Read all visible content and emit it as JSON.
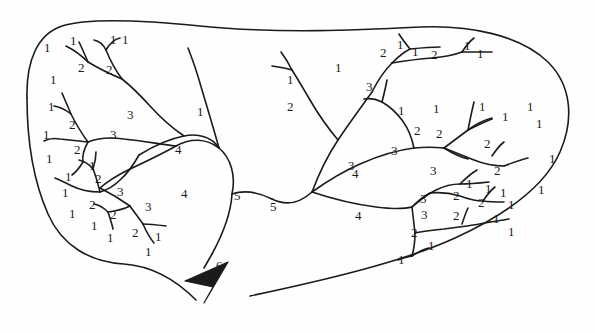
{
  "figure": {
    "type": "stream-order-network-diagram",
    "background_color": "#ffffff",
    "stroke_color": "#1b1b1b",
    "outlet_marker": "arrowhead",
    "max_order": 6,
    "order_counts": {
      "1": 48,
      "2": 19,
      "3": 9,
      "4": 4,
      "5": 2,
      "6": 1
    }
  },
  "labels": [
    {
      "text": "1",
      "x": 44,
      "y": 41
    },
    {
      "text": "1",
      "x": 70,
      "y": 34
    },
    {
      "text": "1",
      "x": 110,
      "y": 33
    },
    {
      "text": "1",
      "x": 122,
      "y": 33
    },
    {
      "text": "2",
      "x": 78,
      "y": 61
    },
    {
      "text": "2",
      "x": 106,
      "y": 63
    },
    {
      "text": "1",
      "x": 50,
      "y": 73
    },
    {
      "text": "1",
      "x": 48,
      "y": 100
    },
    {
      "text": "2",
      "x": 69,
      "y": 118
    },
    {
      "text": "3",
      "x": 127,
      "y": 108
    },
    {
      "text": "3",
      "x": 110,
      "y": 128
    },
    {
      "text": "1",
      "x": 43,
      "y": 128
    },
    {
      "text": "2",
      "x": 74,
      "y": 143
    },
    {
      "text": "1",
      "x": 46,
      "y": 152
    },
    {
      "text": "1",
      "x": 89,
      "y": 159
    },
    {
      "text": "1",
      "x": 65,
      "y": 170
    },
    {
      "text": "2",
      "x": 95,
      "y": 172
    },
    {
      "text": "3",
      "x": 117,
      "y": 185
    },
    {
      "text": "1",
      "x": 62,
      "y": 186
    },
    {
      "text": "2",
      "x": 89,
      "y": 198
    },
    {
      "text": "1",
      "x": 69,
      "y": 207
    },
    {
      "text": "1",
      "x": 91,
      "y": 219
    },
    {
      "text": "2",
      "x": 110,
      "y": 208
    },
    {
      "text": "1",
      "x": 107,
      "y": 231
    },
    {
      "text": "3",
      "x": 145,
      "y": 200
    },
    {
      "text": "2",
      "x": 132,
      "y": 226
    },
    {
      "text": "1",
      "x": 155,
      "y": 230
    },
    {
      "text": "1",
      "x": 145,
      "y": 245
    },
    {
      "text": "4",
      "x": 175,
      "y": 143
    },
    {
      "text": "4",
      "x": 181,
      "y": 187
    },
    {
      "text": "1",
      "x": 197,
      "y": 105
    },
    {
      "text": "5",
      "x": 234,
      "y": 189
    },
    {
      "text": "5",
      "x": 270,
      "y": 200
    },
    {
      "text": "6",
      "x": 216,
      "y": 259
    },
    {
      "text": "1",
      "x": 287,
      "y": 73
    },
    {
      "text": "2",
      "x": 287,
      "y": 100
    },
    {
      "text": "1",
      "x": 335,
      "y": 61
    },
    {
      "text": "3",
      "x": 366,
      "y": 80
    },
    {
      "text": "2",
      "x": 380,
      "y": 46
    },
    {
      "text": "1",
      "x": 397,
      "y": 38
    },
    {
      "text": "1",
      "x": 412,
      "y": 45
    },
    {
      "text": "2",
      "x": 431,
      "y": 48
    },
    {
      "text": "1",
      "x": 464,
      "y": 39
    },
    {
      "text": "1",
      "x": 477,
      "y": 47
    },
    {
      "text": "1",
      "x": 398,
      "y": 104
    },
    {
      "text": "2",
      "x": 414,
      "y": 124
    },
    {
      "text": "1",
      "x": 433,
      "y": 102
    },
    {
      "text": "2",
      "x": 436,
      "y": 127
    },
    {
      "text": "3",
      "x": 391,
      "y": 144
    },
    {
      "text": "1",
      "x": 479,
      "y": 100
    },
    {
      "text": "1",
      "x": 502,
      "y": 110
    },
    {
      "text": "1",
      "x": 527,
      "y": 100
    },
    {
      "text": "2",
      "x": 484,
      "y": 137
    },
    {
      "text": "1",
      "x": 536,
      "y": 117
    },
    {
      "text": "2",
      "x": 494,
      "y": 164
    },
    {
      "text": "1",
      "x": 549,
      "y": 152
    },
    {
      "text": "3",
      "x": 348,
      "y": 159
    },
    {
      "text": "4",
      "x": 352,
      "y": 167
    },
    {
      "text": "3",
      "x": 430,
      "y": 164
    },
    {
      "text": "4",
      "x": 355,
      "y": 209
    },
    {
      "text": "1",
      "x": 538,
      "y": 183
    },
    {
      "text": "2",
      "x": 453,
      "y": 189
    },
    {
      "text": "1",
      "x": 466,
      "y": 177
    },
    {
      "text": "1",
      "x": 485,
      "y": 182
    },
    {
      "text": "3",
      "x": 420,
      "y": 192
    },
    {
      "text": "2",
      "x": 478,
      "y": 196
    },
    {
      "text": "1",
      "x": 500,
      "y": 186
    },
    {
      "text": "1",
      "x": 508,
      "y": 198
    },
    {
      "text": "3",
      "x": 421,
      "y": 208
    },
    {
      "text": "2",
      "x": 453,
      "y": 209
    },
    {
      "text": "1",
      "x": 493,
      "y": 212
    },
    {
      "text": "1",
      "x": 508,
      "y": 225
    },
    {
      "text": "2",
      "x": 411,
      "y": 226
    },
    {
      "text": "1",
      "x": 428,
      "y": 239
    },
    {
      "text": "1",
      "x": 398,
      "y": 253
    }
  ]
}
